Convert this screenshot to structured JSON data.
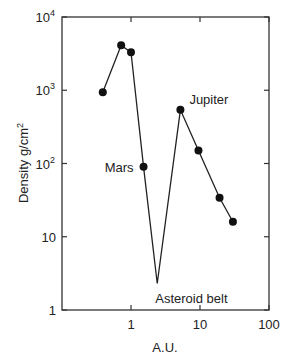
{
  "chart_data": {
    "type": "line",
    "title": "",
    "xlabel": "A.U.",
    "ylabel": "Density g/cm²",
    "xscale": "log",
    "yscale": "log",
    "xlim": [
      0.1,
      100
    ],
    "ylim": [
      1,
      10000
    ],
    "x_ticks": [
      {
        "value": 1,
        "label": "1"
      },
      {
        "value": 10,
        "label": "10"
      },
      {
        "value": 100,
        "label": "100"
      }
    ],
    "y_ticks": [
      {
        "value": 1,
        "label": "1",
        "sup": ""
      },
      {
        "value": 10,
        "label": "10",
        "sup": ""
      },
      {
        "value": 100,
        "label": "10",
        "sup": "2"
      },
      {
        "value": 1000,
        "label": "10",
        "sup": "3"
      },
      {
        "value": 10000,
        "label": "10",
        "sup": "4"
      }
    ],
    "grid": false,
    "legend": null,
    "series": [
      {
        "name": "Surface density",
        "x": [
          0.39,
          0.72,
          1.0,
          1.52,
          2.4,
          5.2,
          9.5,
          19.2,
          30
        ],
        "y": [
          940,
          4100,
          3300,
          90,
          2.3,
          540,
          150,
          34,
          16
        ],
        "markers": [
          true,
          true,
          true,
          true,
          false,
          true,
          true,
          true,
          true
        ]
      }
    ],
    "annotations": [
      {
        "text": "Mars",
        "x": 1.52,
        "y": 90,
        "position": "left"
      },
      {
        "text": "Jupiter",
        "x": 5.2,
        "y": 540,
        "position": "above-right"
      },
      {
        "text": "Asteroid belt",
        "x": 2.4,
        "y": 2.3,
        "position": "below"
      }
    ]
  }
}
